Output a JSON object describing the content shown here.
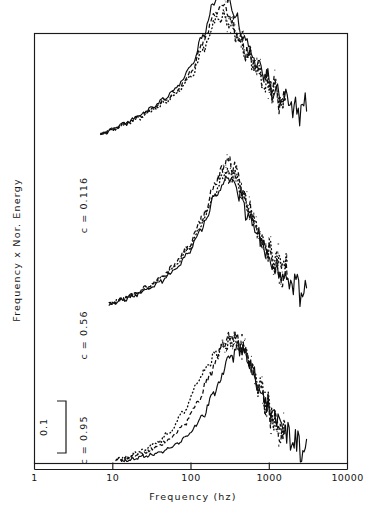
{
  "figure": {
    "name": "frequency-weighted-normalized-energy-spectra",
    "background_color": "#ffffff",
    "ink_color": "#0d0d0d"
  },
  "axes": {
    "x_title": "Frequency (hz)",
    "y_title": "Frequency x Nor. Energy",
    "x_tick_labels": [
      "1",
      "10",
      "100",
      "1000",
      "10000"
    ],
    "x_scale": "log10",
    "y_scale": "linear-offset-stacked"
  },
  "scale_bar": {
    "label": "0.1",
    "description": "vertical bracket denoting 0.1 units of Frequency x Nor. Energy"
  },
  "curve_labels": [
    {
      "text": "c = 0.116"
    },
    {
      "text": "c = 0.56"
    },
    {
      "text": "c = 0.95"
    }
  ],
  "chart_data": {
    "type": "line",
    "title": "",
    "xlabel": "Frequency (hz)",
    "ylabel": "Frequency x Nor. Energy",
    "xscale": "log",
    "xlim": [
      1,
      10000
    ],
    "xticks": [
      1,
      10,
      100,
      1000,
      10000
    ],
    "xticklabels": [
      "1",
      "10",
      "100",
      "1000",
      "10000"
    ],
    "grid": false,
    "legend": "none",
    "scale_bar_value": 0.1,
    "annotations": [
      "c = 0.116",
      "c = 0.56",
      "c = 0.95"
    ],
    "note": "Three vertically offset groups of spectra; each group contains a solid, a dashed and a dotted trace. Values are frequency-weighted normalized energy in arbitrary offset units.",
    "groups": [
      {
        "label": "c = 0.116",
        "offset": 0.62,
        "series": [
          {
            "name": "c = 0.116 solid",
            "style": "solid",
            "x": [
              7,
              10,
              15,
              22,
              32,
              47,
              68,
              100,
              145,
              200,
              250,
              300,
              360,
              430,
              520,
              620,
              750,
              900,
              1100,
              1350,
              1650,
              2000,
              2400,
              3000
            ],
            "y": [
              0.013,
              0.022,
              0.034,
              0.048,
              0.064,
              0.082,
              0.105,
              0.142,
              0.205,
              0.268,
              0.288,
              0.272,
              0.242,
              0.212,
              0.186,
              0.16,
              0.138,
              0.118,
              0.1,
              0.086,
              0.076,
              0.068,
              0.062,
              0.058
            ]
          },
          {
            "name": "c = 0.116 dashed",
            "style": "dashed",
            "x": [
              7,
              10,
              15,
              22,
              32,
              47,
              68,
              100,
              145,
              200,
              250,
              300,
              360,
              430,
              520,
              620,
              750,
              900,
              1100,
              1350,
              1600
            ],
            "y": [
              0.013,
              0.022,
              0.033,
              0.046,
              0.061,
              0.078,
              0.098,
              0.132,
              0.19,
              0.245,
              0.258,
              0.246,
              0.22,
              0.196,
              0.172,
              0.15,
              0.13,
              0.112,
              0.096,
              0.084,
              0.078
            ]
          },
          {
            "name": "c = 0.116 dotted",
            "style": "dotted",
            "x": [
              7,
              10,
              15,
              22,
              32,
              47,
              68,
              100,
              145,
              200,
              250,
              300,
              360,
              430,
              520,
              620,
              750,
              900,
              1100,
              1350,
              1600
            ],
            "y": [
              0.013,
              0.021,
              0.032,
              0.044,
              0.058,
              0.074,
              0.093,
              0.124,
              0.176,
              0.226,
              0.238,
              0.23,
              0.208,
              0.188,
              0.168,
              0.148,
              0.13,
              0.114,
              0.1,
              0.09,
              0.085
            ]
          }
        ]
      },
      {
        "label": "c = 0.56",
        "offset": 0.3,
        "series": [
          {
            "name": "c = 0.56 solid",
            "style": "solid",
            "x": [
              9,
              13,
              19,
              28,
              42,
              62,
              92,
              135,
              200,
              280,
              360,
              430,
              520,
              620,
              750,
              900,
              1100,
              1350,
              1650,
              2000,
              2500,
              3000
            ],
            "y": [
              0.006,
              0.013,
              0.022,
              0.034,
              0.05,
              0.072,
              0.103,
              0.15,
              0.208,
              0.246,
              0.236,
              0.212,
              0.184,
              0.156,
              0.128,
              0.104,
              0.082,
              0.064,
              0.05,
              0.04,
              0.032,
              0.028
            ]
          },
          {
            "name": "c = 0.56 dashed",
            "style": "dashed",
            "x": [
              9,
              13,
              19,
              28,
              42,
              62,
              92,
              135,
              200,
              280,
              340,
              400,
              470,
              560,
              670,
              800,
              960,
              1150,
              1400,
              1700
            ],
            "y": [
              0.007,
              0.015,
              0.026,
              0.04,
              0.058,
              0.082,
              0.116,
              0.168,
              0.232,
              0.282,
              0.276,
              0.252,
              0.222,
              0.19,
              0.158,
              0.128,
              0.102,
              0.082,
              0.066,
              0.056
            ]
          },
          {
            "name": "c = 0.56 dotted",
            "style": "dotted",
            "x": [
              9,
              13,
              19,
              28,
              42,
              62,
              92,
              135,
              200,
              280,
              340,
              400,
              470,
              560,
              670,
              800,
              960,
              1150,
              1400,
              1700
            ],
            "y": [
              0.007,
              0.014,
              0.025,
              0.038,
              0.055,
              0.078,
              0.11,
              0.158,
              0.216,
              0.262,
              0.258,
              0.238,
              0.212,
              0.184,
              0.156,
              0.13,
              0.108,
              0.09,
              0.076,
              0.068
            ]
          }
        ]
      },
      {
        "label": "c = 0.95",
        "offset": 0.0,
        "series": [
          {
            "name": "c = 0.95 solid",
            "style": "solid",
            "x": [
              13,
              19,
              28,
              42,
              62,
              92,
              135,
              200,
              300,
              420,
              520,
              620,
              750,
              900,
              1100,
              1350,
              1650,
              2000,
              2500,
              3000
            ],
            "y": [
              0.004,
              0.008,
              0.014,
              0.022,
              0.034,
              0.054,
              0.086,
              0.134,
              0.196,
              0.224,
              0.206,
              0.178,
              0.148,
              0.12,
              0.094,
              0.072,
              0.054,
              0.04,
              0.03,
              0.024
            ]
          },
          {
            "name": "c = 0.95 dashed",
            "style": "dashed",
            "x": [
              11,
              16,
              24,
              36,
              54,
              80,
              118,
              175,
              260,
              360,
              450,
              540,
              650,
              780,
              940,
              1130,
              1350,
              1600
            ],
            "y": [
              0.006,
              0.011,
              0.019,
              0.03,
              0.046,
              0.072,
              0.112,
              0.17,
              0.228,
              0.246,
              0.226,
              0.198,
              0.166,
              0.134,
              0.104,
              0.08,
              0.062,
              0.052
            ]
          },
          {
            "name": "c = 0.95 dotted",
            "style": "dotted",
            "x": [
              11,
              16,
              24,
              36,
              54,
              80,
              118,
              160,
              210,
              280,
              360,
              450,
              540,
              650,
              780,
              940,
              1130,
              1350,
              1600
            ],
            "y": [
              0.007,
              0.013,
              0.023,
              0.038,
              0.06,
              0.098,
              0.15,
              0.186,
              0.21,
              0.228,
              0.236,
              0.22,
              0.196,
              0.168,
              0.138,
              0.11,
              0.086,
              0.07,
              0.062
            ]
          }
        ]
      }
    ]
  }
}
